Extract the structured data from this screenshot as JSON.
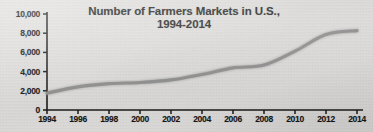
{
  "chart_data": {
    "type": "line",
    "title": "Number of Farmers Markets in U.S.,",
    "title_line2": "1994-2014",
    "xlabel": "",
    "ylabel": "",
    "grid": false,
    "legend": "none",
    "xlim": [
      1994,
      2014
    ],
    "ylim": [
      0,
      10000
    ],
    "x_tick_labels": [
      "1994",
      "1996",
      "1998",
      "2000",
      "2002",
      "2004",
      "2006",
      "2008",
      "2010",
      "2012",
      "2014"
    ],
    "x_ticks": [
      1994,
      1996,
      1998,
      2000,
      2002,
      2004,
      2006,
      2008,
      2010,
      2012,
      2014
    ],
    "y_tick_labels": [
      "0",
      "2,000",
      "4,000",
      "6,000",
      "8,000",
      "10,000"
    ],
    "y_ticks": [
      0,
      2000,
      4000,
      6000,
      8000,
      10000
    ],
    "x": [
      1994,
      1996,
      1998,
      2000,
      2002,
      2004,
      2006,
      2008,
      2010,
      2012,
      2014
    ],
    "values": [
      1755,
      2410,
      2746,
      2863,
      3137,
      3706,
      4385,
      4685,
      6132,
      7864,
      8268
    ],
    "series": [
      {
        "name": "Number of Farmers Markets",
        "color": "#8c8c8c",
        "values": [
          1755,
          2410,
          2746,
          2863,
          3137,
          3706,
          4385,
          4685,
          6132,
          7864,
          8268
        ]
      }
    ],
    "line_color": "#8c8c8c",
    "axis_color": "#1a1a1a",
    "background_color": "#dcdcda"
  },
  "geometry": {
    "plot_left": 47,
    "plot_right": 357,
    "plot_top": 14,
    "plot_bottom": 110
  }
}
